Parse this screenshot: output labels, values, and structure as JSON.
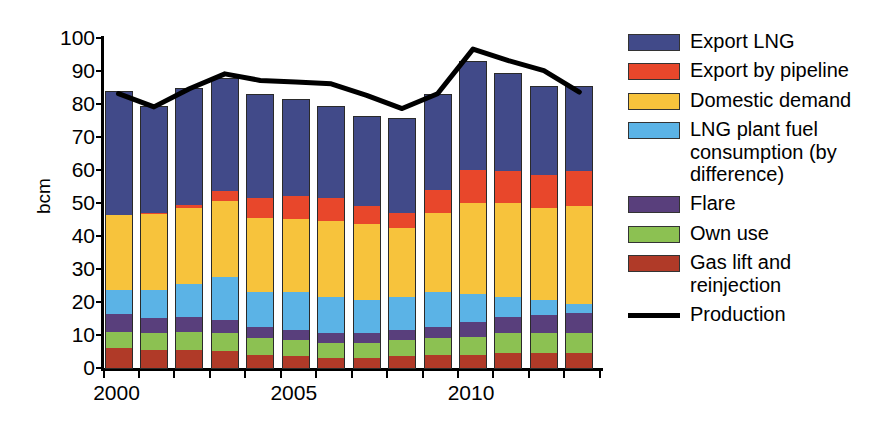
{
  "chart_data": {
    "type": "bar",
    "stacked": true,
    "title": "",
    "xlabel": "",
    "ylabel": "bcm",
    "ylim": [
      0,
      100
    ],
    "ytick_step": 10,
    "yticks": [
      0,
      10,
      20,
      30,
      40,
      50,
      60,
      70,
      80,
      90,
      100
    ],
    "grid": false,
    "legend_position": "right",
    "categories": [
      2000,
      2001,
      2002,
      2003,
      2004,
      2005,
      2006,
      2007,
      2008,
      2009,
      2010,
      2011,
      2012,
      2013
    ],
    "xtick_labels": [
      "2000",
      "",
      "",
      "",
      "",
      "2005",
      "",
      "",
      "",
      "",
      "2010",
      "",
      "",
      ""
    ],
    "series": [
      {
        "name": "Gas lift and reinjection",
        "color": "#b03a28",
        "values": [
          6.0,
          5.5,
          5.5,
          5.0,
          4.0,
          3.5,
          3.0,
          3.0,
          3.5,
          4.0,
          4.0,
          4.5,
          4.5,
          4.5
        ]
      },
      {
        "name": "Own use",
        "color": "#8cc152",
        "values": [
          5.0,
          5.0,
          5.5,
          5.5,
          5.0,
          5.0,
          4.5,
          4.5,
          5.0,
          5.0,
          5.5,
          6.0,
          6.0,
          6.0
        ]
      },
      {
        "name": "Flare",
        "color": "#593f7c",
        "values": [
          5.2,
          4.5,
          4.5,
          4.0,
          3.5,
          3.0,
          3.0,
          3.0,
          3.0,
          3.5,
          4.5,
          5.0,
          5.5,
          6.0
        ]
      },
      {
        "name": "LNG plant fuel consumption (by difference)",
        "color": "#5bb3e6",
        "values": [
          7.4,
          8.5,
          10.0,
          13.0,
          10.5,
          11.5,
          11.0,
          10.0,
          10.0,
          10.5,
          8.5,
          6.0,
          4.5,
          3.0
        ]
      },
      {
        "name": "Domestic demand",
        "color": "#f7c33c",
        "values": [
          22.7,
          23.0,
          23.0,
          23.0,
          22.5,
          22.0,
          23.0,
          23.0,
          21.0,
          24.0,
          27.5,
          28.5,
          28.0,
          29.5
        ]
      },
      {
        "name": "Export by pipeline",
        "color": "#e8472b",
        "values": [
          0.0,
          0.5,
          0.8,
          3.0,
          6.0,
          7.0,
          7.0,
          5.5,
          4.5,
          7.0,
          10.0,
          9.5,
          10.0,
          10.5
        ]
      },
      {
        "name": "Export LNG",
        "color": "#414a89",
        "values": [
          37.3,
          32.0,
          35.0,
          34.0,
          31.0,
          29.0,
          27.5,
          27.0,
          28.5,
          28.5,
          32.5,
          29.5,
          26.5,
          25.5
        ]
      }
    ],
    "line_series": {
      "name": "Production",
      "color": "#000000",
      "values": [
        83.0,
        79.0,
        84.5,
        89.0,
        87.0,
        86.5,
        86.0,
        82.5,
        78.5,
        83.0,
        96.5,
        93.0,
        90.0,
        83.5
      ]
    },
    "totals": [
      83.6,
      79.0,
      84.3,
      87.5,
      82.5,
      81.0,
      79.0,
      76.0,
      75.5,
      82.5,
      92.5,
      89.0,
      85.0,
      85.0
    ]
  },
  "legend": {
    "items": [
      {
        "label": "Export LNG",
        "color": "#414a89",
        "kind": "swatch"
      },
      {
        "label": "Export by pipeline",
        "color": "#e8472b",
        "kind": "swatch"
      },
      {
        "label": "Domestic demand",
        "color": "#f7c33c",
        "kind": "swatch"
      },
      {
        "label": "LNG plant fuel\nconsumption (by\ndifference)",
        "color": "#5bb3e6",
        "kind": "swatch"
      },
      {
        "label": "Flare",
        "color": "#593f7c",
        "kind": "swatch"
      },
      {
        "label": "Own use",
        "color": "#8cc152",
        "kind": "swatch"
      },
      {
        "label": "Gas lift and\nreinjection",
        "color": "#b03a28",
        "kind": "swatch"
      },
      {
        "label": "Production",
        "color": "#000000",
        "kind": "line"
      }
    ]
  }
}
